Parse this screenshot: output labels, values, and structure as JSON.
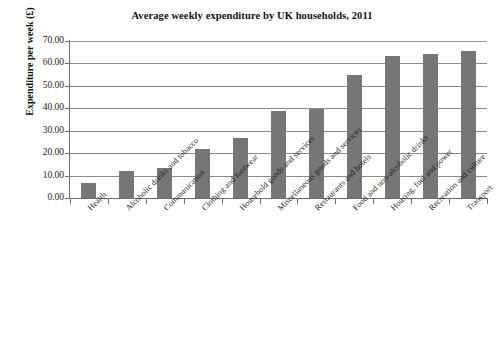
{
  "chart_data": {
    "type": "bar",
    "title": "Average weekly expenditure by UK households, 2011",
    "xlabel": "",
    "ylabel": "Expenditure per week (£)",
    "ylim": [
      0,
      70
    ],
    "ytick_step": 10,
    "ytick_labels": [
      "0.00",
      "10.00",
      "20.00",
      "30.00",
      "40.00",
      "50.00",
      "60.00",
      "70.00"
    ],
    "ytick_values": [
      0,
      10,
      20,
      30,
      40,
      50,
      60,
      70
    ],
    "grid": true,
    "legend": false,
    "bar_color": "#767676",
    "categories": [
      "Health",
      "Alcoholic drinks and tobacco",
      "Communication",
      "Clothing and footwear",
      "Household goods and services",
      "Miscellaneous goods and services",
      "Restaurants and hotels",
      "Food and non-alcoholic drinks",
      "Housing, fuel and power",
      "Recreation and culture",
      "Transport"
    ],
    "values": [
      6.5,
      11.9,
      13.2,
      21.7,
      26.9,
      38.7,
      39.6,
      54.8,
      63.3,
      64.1,
      65.7
    ]
  }
}
